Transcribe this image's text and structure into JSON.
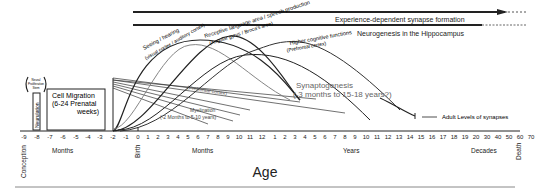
{
  "bars": {
    "experience": "Experience-dependent synapse formation",
    "neurogenesis": "Neurogenesis in the Hippocampus"
  },
  "boxes": {
    "neurulation": "Neurulation",
    "neural_proliferation_l1": "Neural",
    "neural_proliferation_l2": "Proliferation",
    "neural_proliferation_l3": "Stem",
    "cell_migration_l1": "Cell Migration",
    "cell_migration_l2": "(6-24 Prenatal",
    "cell_migration_l3": "weeks)"
  },
  "curves": {
    "sensing": "Seeing / hearing",
    "sensing_sub": "(visual cortex / auditory cortex)",
    "receptive": "Receptive language area / speech production",
    "receptive_sub": "(Angular gyrus / Broca's area)",
    "higher": "Higher cognitive functions",
    "higher_sub": "(Prefrontal cortex)",
    "prefrontal": "(Prefrontal cortex)",
    "myelination": "Myelination",
    "myelination_sub": "(-2 Months to 5-10 years)"
  },
  "synaptogenesis": {
    "label": "Synaptogenesis",
    "range": "(-3 months to 15-18 years?)"
  },
  "adult": "Adult Levels of synapses",
  "axis": {
    "ticks_prenatal": [
      "-9",
      "-8",
      "-7",
      "-6",
      "-5",
      "-4",
      "-3",
      "-2",
      "-1"
    ],
    "ticks_months": [
      "0",
      "1",
      "2",
      "3",
      "4",
      "5",
      "6",
      "7",
      "8",
      "9",
      "10",
      "11",
      "12"
    ],
    "ticks_years": [
      "1",
      "2",
      "3",
      "4",
      "5",
      "6",
      "7",
      "8",
      "9",
      "10",
      "11",
      "12",
      "13",
      "14",
      "15",
      "16",
      "17",
      "18",
      "19",
      "20"
    ],
    "ticks_decades": [
      "30",
      "40",
      "50",
      "60",
      "70"
    ],
    "labels": {
      "conception": "Conception",
      "months_prenatal": "Months",
      "birth": "Birth",
      "months": "Months",
      "years": "Years",
      "decades": "Decades",
      "death": "Death"
    },
    "title": "Age"
  }
}
